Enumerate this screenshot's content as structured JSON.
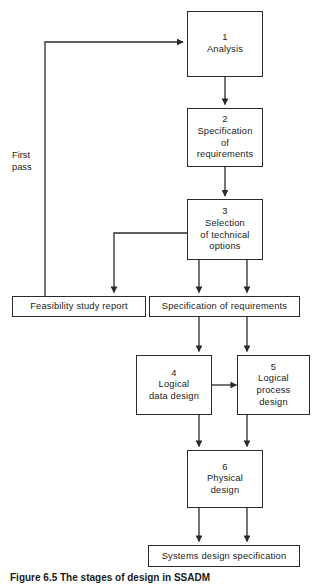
{
  "figure": {
    "caption": "Figure 6.5 The stages of design in SSADM",
    "background": "#ffffff",
    "line_color": "#2b2b2b",
    "text_color": "#1a1a1a"
  },
  "diagram": {
    "type": "flowchart",
    "title": "The stages of design in SSADM",
    "loop_label": "First\npass",
    "nodes": [
      {
        "id": "n1",
        "num": "1",
        "title": "Analysis",
        "shape": "process"
      },
      {
        "id": "n2",
        "num": "2",
        "title": "Specification\nof\nrequirements",
        "shape": "process"
      },
      {
        "id": "n3",
        "num": "3",
        "title": "Selection\nof technical\noptions",
        "shape": "process"
      },
      {
        "id": "n4",
        "num": "4",
        "title": "Logical\ndata design",
        "shape": "process"
      },
      {
        "id": "n5",
        "num": "5",
        "title": "Logical\nprocess\ndesign",
        "shape": "process"
      },
      {
        "id": "n6",
        "num": "6",
        "title": "Physical\ndesign",
        "shape": "process"
      }
    ],
    "documents": [
      {
        "id": "d1",
        "label": "Feasibility study report"
      },
      {
        "id": "d2",
        "label": "Specification of requirements"
      },
      {
        "id": "d3",
        "label": "Systems design specification"
      }
    ],
    "edges": [
      {
        "from": "n1",
        "to": "n2",
        "label": ""
      },
      {
        "from": "n2",
        "to": "n3",
        "label": ""
      },
      {
        "from": "n3",
        "to": "d1",
        "label": ""
      },
      {
        "from": "n3",
        "to": "d2",
        "label": ""
      },
      {
        "from": "d2",
        "to": "n4",
        "label": ""
      },
      {
        "from": "d2",
        "to": "n5",
        "label": ""
      },
      {
        "from": "n4",
        "to": "n5",
        "label": ""
      },
      {
        "from": "n4",
        "to": "n6",
        "label": ""
      },
      {
        "from": "n5",
        "to": "n6",
        "label": ""
      },
      {
        "from": "n6",
        "to": "d3",
        "label": ""
      },
      {
        "from": "d1",
        "to": "n1",
        "label": "First pass"
      }
    ]
  }
}
